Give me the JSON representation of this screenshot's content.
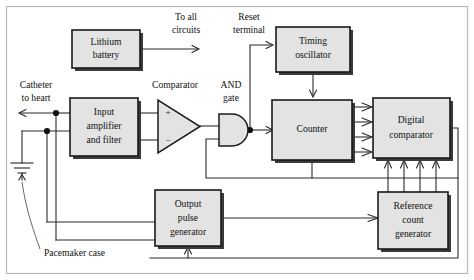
{
  "diagram": {
    "blocks": [
      {
        "id": "lithium_battery",
        "label_lines": [
          "Lithium",
          "battery"
        ],
        "x": 72,
        "y": 30,
        "w": 68,
        "h": 38
      },
      {
        "id": "timing_oscillator",
        "label_lines": [
          "Timing",
          "oscillator"
        ],
        "x": 276,
        "y": 27,
        "w": 74,
        "h": 45
      },
      {
        "id": "input_amplifier",
        "label_lines": [
          "Input",
          "amplifier",
          "and filter"
        ],
        "x": 70,
        "y": 98,
        "w": 68,
        "h": 58
      },
      {
        "id": "counter",
        "label_lines": [
          "Counter"
        ],
        "x": 272,
        "y": 100,
        "w": 80,
        "h": 60
      },
      {
        "id": "digital_comparator",
        "label_lines": [
          "Digital",
          "comparator"
        ],
        "x": 373,
        "y": 98,
        "w": 77,
        "h": 60
      },
      {
        "id": "output_pulse_generator",
        "label_lines": [
          "Output",
          "pulse",
          "generator"
        ],
        "x": 155,
        "y": 190,
        "w": 66,
        "h": 56
      },
      {
        "id": "reference_count_generator",
        "label_lines": [
          "Reference",
          "count",
          "generator"
        ],
        "x": 378,
        "y": 192,
        "w": 70,
        "h": 57
      }
    ],
    "free_labels": [
      {
        "id": "to_all_circuits",
        "lines": [
          "To all",
          "circuits"
        ],
        "x": 186,
        "y": 18
      },
      {
        "id": "reset_terminal",
        "lines": [
          "Reset",
          "terminal"
        ],
        "x": 249,
        "y": 18
      },
      {
        "id": "catheter_to_heart",
        "lines": [
          "Catheter",
          "to heart"
        ],
        "x": 36,
        "y": 86
      },
      {
        "id": "comparator",
        "lines": [
          "Comparator"
        ],
        "x": 175,
        "y": 86
      },
      {
        "id": "and_gate",
        "lines": [
          "AND",
          "gate"
        ],
        "x": 231,
        "y": 86
      },
      {
        "id": "pacemaker_case",
        "lines": [
          "Pacemaker case"
        ],
        "x": 73,
        "y": 254
      }
    ],
    "gate_signs": {
      "plus": "+",
      "minus": "−"
    },
    "colors": {
      "block_fill": "#e3e3e3",
      "block_stroke": "#1a1a1a",
      "wire": "#2b2b2b",
      "frame": "#b9b9b9",
      "background": "#ffffff"
    },
    "bus_widths": {
      "counter_to_comparator": 4,
      "reference_to_comparator": 4
    }
  }
}
